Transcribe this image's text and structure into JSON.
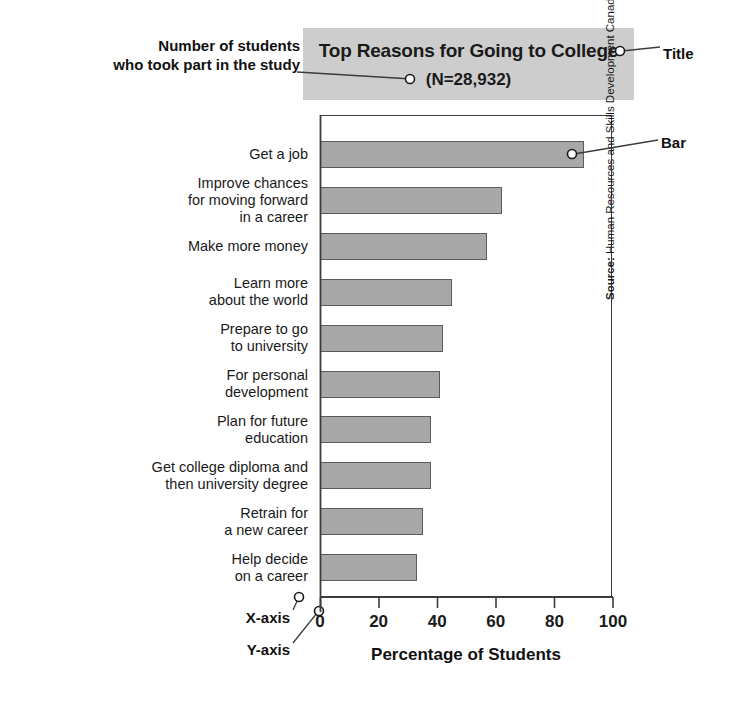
{
  "title": {
    "main": "Top Reasons for Going to College",
    "subtitle": "(N=28,932)"
  },
  "annotations": {
    "sample_size": "Number of students\nwho took part in the study",
    "title_callout": "Title",
    "bar_callout": "Bar",
    "x_axis_callout": "X-axis",
    "y_axis_callout": "Y-axis"
  },
  "source": {
    "prefix": "Source:",
    "text": " Human Resources and Skills Development Canada, 2007."
  },
  "axis": {
    "x_title": "Percentage of Students",
    "ticks": [
      "0",
      "20",
      "40",
      "60",
      "80",
      "100"
    ]
  },
  "colors": {
    "bar_fill": "#a8a8a8",
    "bar_stroke": "#5b5b5b",
    "title_band": "#cdcdcd",
    "axis": "#3c3c3c",
    "text": "#1a1a1a"
  },
  "chart_data": {
    "type": "bar",
    "orientation": "horizontal",
    "title": "Top Reasons for Going to College (N=28,932)",
    "xlabel": "Percentage of Students",
    "ylabel": "",
    "xlim": [
      0,
      100
    ],
    "grid": false,
    "legend": null,
    "categories": [
      "Get a job",
      "Improve chances\nfor moving forward\nin a career",
      "Make more money",
      "Learn more\nabout the world",
      "Prepare to go\nto university",
      "For personal\ndevelopment",
      "Plan for future\neducation",
      "Get college diploma and\nthen university degree",
      "Retrain for\na new career",
      "Help decide\non a career"
    ],
    "values": [
      90,
      62,
      57,
      45,
      42,
      41,
      38,
      38,
      35,
      33
    ],
    "tick_values": [
      0,
      20,
      40,
      60,
      80,
      100
    ],
    "source": "Source: Human Resources and Skills Development Canada, 2007."
  }
}
